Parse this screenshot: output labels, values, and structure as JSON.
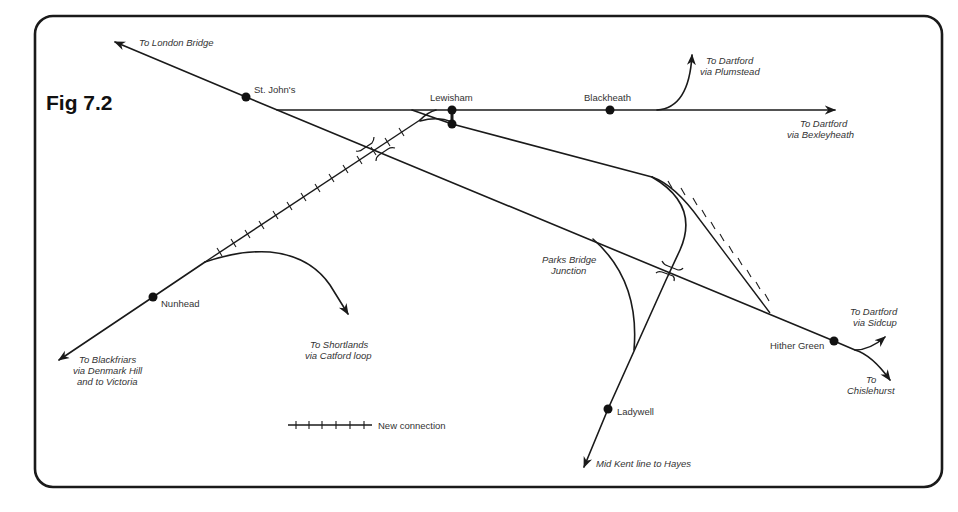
{
  "figure": {
    "title": "Fig 7.2"
  },
  "stations": [
    {
      "name": "St. John's",
      "x": 246,
      "y": 97
    },
    {
      "name": "Lewisham",
      "x": 452,
      "y": 110
    },
    {
      "name": "Blackheath",
      "x": 610,
      "y": 110
    },
    {
      "name": "Nunhead",
      "x": 153,
      "y": 297
    },
    {
      "name": "Hither Green",
      "x": 834,
      "y": 341
    },
    {
      "name": "Ladywell",
      "x": 608,
      "y": 409
    }
  ],
  "destinations": {
    "london_bridge": "To London Bridge",
    "dartford_plumstead": [
      "To Dartford",
      "via Plumstead"
    ],
    "dartford_bexleyheath": [
      "To Dartford",
      "via Bexleyheath"
    ],
    "blackfriars": [
      "To Blackfriars",
      "via Denmark Hill",
      "and to Victoria"
    ],
    "shortlands": [
      "To Shortlands",
      "via Catford loop"
    ],
    "dartford_sidcup": [
      "To Dartford",
      "via Sidcup"
    ],
    "chislehurst": [
      "To",
      "Chislehurst"
    ],
    "hayes": "Mid Kent line to Hayes"
  },
  "junctions": {
    "parks_bridge": [
      "Parks Bridge",
      "Junction"
    ]
  },
  "legend": {
    "new_connection": "New connection"
  },
  "colors": {
    "line": "#1a1a1a",
    "text": "#333333",
    "background": "#ffffff"
  }
}
